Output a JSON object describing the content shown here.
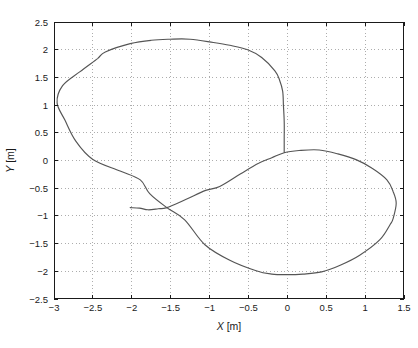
{
  "figure": {
    "width": 418,
    "height": 348,
    "background": "#ffffff",
    "frame_color": "#1a1a1a",
    "grid_color": "#adadad",
    "curve_color": "#555555",
    "text_color": "#1a1a1a"
  },
  "chart_data": {
    "type": "line",
    "title": "",
    "xlabel": "X [m]",
    "ylabel": "Y [m]",
    "xlim": [
      -3,
      1.5
    ],
    "ylim": [
      -2.5,
      2.5
    ],
    "x_ticks": [
      -3,
      -2.5,
      -2,
      -1.5,
      -1,
      -0.5,
      0,
      0.5,
      1,
      1.5
    ],
    "y_ticks": [
      -2.5,
      -2,
      -1.5,
      -1,
      -0.5,
      0,
      0.5,
      1,
      1.5,
      2,
      2.5
    ],
    "grid": true,
    "grid_style": "dotted",
    "legend": null,
    "series": [
      {
        "name": "xy-trajectory",
        "description": "Figure-eight robot trajectory in the XY plane: short start tail near (-2,-0.85), self-crossing near (-1.55,-0.85), lower-right loop down to y=-2.06 and right to x=1.40, upper-left loop up to y=2.19 and left to x=-2.96, closing with a steep descent at x=-0.04",
        "points": [
          [
            -2.02,
            -0.85
          ],
          [
            -1.9,
            -0.86
          ],
          [
            -1.79,
            -0.89
          ],
          [
            -1.66,
            -0.87
          ],
          [
            -1.55,
            -0.85
          ],
          [
            -1.3,
            -0.7
          ],
          [
            -1.05,
            -0.54
          ],
          [
            -0.87,
            -0.47
          ],
          [
            -0.6,
            -0.24
          ],
          [
            -0.37,
            -0.05
          ],
          [
            -0.2,
            0.05
          ],
          [
            -0.04,
            0.14
          ],
          [
            0.15,
            0.18
          ],
          [
            0.41,
            0.19
          ],
          [
            0.65,
            0.12
          ],
          [
            0.89,
            0.01
          ],
          [
            1.09,
            -0.14
          ],
          [
            1.28,
            -0.35
          ],
          [
            1.36,
            -0.56
          ],
          [
            1.4,
            -0.77
          ],
          [
            1.36,
            -1.05
          ],
          [
            1.32,
            -1.16
          ],
          [
            1.19,
            -1.43
          ],
          [
            0.93,
            -1.71
          ],
          [
            0.68,
            -1.89
          ],
          [
            0.44,
            -2.01
          ],
          [
            0.2,
            -2.05
          ],
          [
            0.0,
            -2.06
          ],
          [
            -0.2,
            -2.05
          ],
          [
            -0.4,
            -1.99
          ],
          [
            -0.74,
            -1.8
          ],
          [
            -1.06,
            -1.52
          ],
          [
            -1.32,
            -1.07
          ],
          [
            -1.55,
            -0.85
          ],
          [
            -1.77,
            -0.6
          ],
          [
            -1.89,
            -0.35
          ],
          [
            -2.15,
            -0.19
          ],
          [
            -2.5,
            0.02
          ],
          [
            -2.72,
            0.35
          ],
          [
            -2.86,
            0.73
          ],
          [
            -2.96,
            1.04
          ],
          [
            -2.89,
            1.35
          ],
          [
            -2.67,
            1.6
          ],
          [
            -2.44,
            1.84
          ],
          [
            -2.34,
            1.96
          ],
          [
            -2.02,
            2.11
          ],
          [
            -1.75,
            2.17
          ],
          [
            -1.51,
            2.19
          ],
          [
            -1.25,
            2.19
          ],
          [
            -0.95,
            2.13
          ],
          [
            -0.74,
            2.08
          ],
          [
            -0.51,
            2.0
          ],
          [
            -0.33,
            1.86
          ],
          [
            -0.16,
            1.62
          ],
          [
            -0.1,
            1.45
          ],
          [
            -0.06,
            1.25
          ],
          [
            -0.05,
            1.0
          ],
          [
            -0.04,
            0.7
          ],
          [
            -0.04,
            0.4
          ],
          [
            -0.04,
            0.15
          ]
        ]
      }
    ]
  }
}
